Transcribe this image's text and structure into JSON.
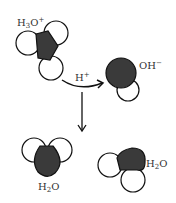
{
  "diagram": {
    "type": "reaction",
    "colors": {
      "oxygen": "#3a3a3a",
      "hydrogen": "#ffffff",
      "stroke": "#111111"
    },
    "labels": {
      "hydronium": {
        "base": "H",
        "sub": "3",
        "mid": "O",
        "sup": "+"
      },
      "proton": {
        "base": "H",
        "sup": "+"
      },
      "hydroxide": {
        "base": "OH",
        "sup": "−"
      },
      "water_left": {
        "base": "H",
        "sub": "2",
        "mid": "O"
      },
      "water_right": {
        "base": "H",
        "sub": "2",
        "mid": "O"
      }
    }
  }
}
